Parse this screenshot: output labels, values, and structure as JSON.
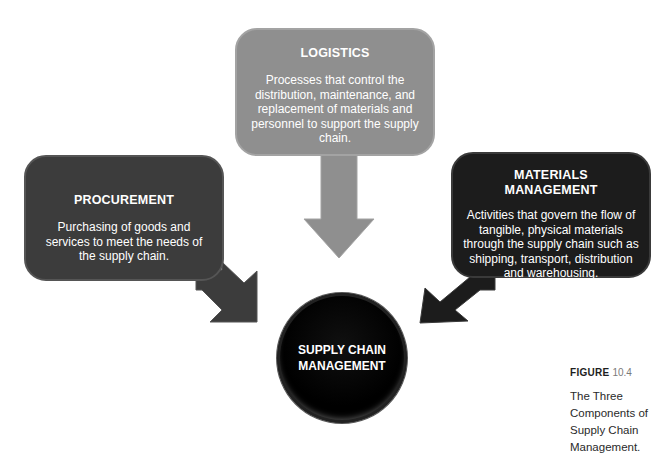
{
  "figure": {
    "label": "FIGURE",
    "number": "10.4",
    "caption": "The Three Components of Supply Chain Management."
  },
  "hub": {
    "line1": "SUPPLY CHAIN",
    "line2": "MANAGEMENT"
  },
  "components": [
    {
      "title": "LOGISTICS",
      "description": "Processes that control the distribution, maintenance, and replacement of materials and personnel to support the supply chain.",
      "color": "#8f8f8f",
      "arrow_direction": "down"
    },
    {
      "title": "PROCUREMENT",
      "description": "Purchasing of goods and services to meet the needs of the supply chain.",
      "color": "#3c3c3c",
      "arrow_direction": "down-right"
    },
    {
      "title": "MATERIALS MANAGEMENT",
      "title_line1": "MATERIALS",
      "title_line2": "MANAGEMENT",
      "description": "Activities that govern the flow of tangible, physical materials through the supply chain such as shipping, transport, distribution and warehousing.",
      "color": "#1c1c1c",
      "arrow_direction": "down-left"
    }
  ]
}
